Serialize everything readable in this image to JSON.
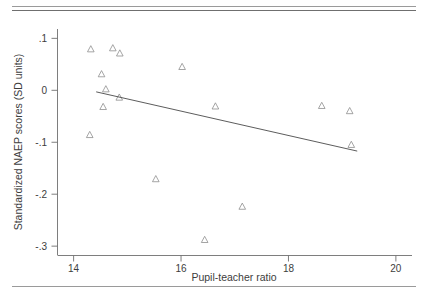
{
  "figure": {
    "background": "#ffffff",
    "rules": [
      {
        "name": "top-rule-upper",
        "color": "#9a9a9a"
      },
      {
        "name": "top-rule-lower",
        "color": "#6f6f6f"
      },
      {
        "name": "bottom-rule",
        "color": "#9a9a9a"
      }
    ]
  },
  "chart_data": {
    "type": "scatter",
    "title": "",
    "xlabel": "Pupil-teacher ratio",
    "ylabel": "Standardized NAEP scores (SD units)",
    "xlim": [
      13.7,
      20.3
    ],
    "ylim": [
      -0.318,
      0.118
    ],
    "xticks": [
      14,
      16,
      18,
      20
    ],
    "xticklabels": [
      "14",
      "16",
      "18",
      "20"
    ],
    "yticks": [
      0.1,
      0,
      -0.1,
      -0.2,
      -0.3
    ],
    "yticklabels": [
      ".1",
      "0",
      "-.1",
      "-.2",
      "-.3"
    ],
    "grid": false,
    "legend": false,
    "marker": "triangle-up-open",
    "marker_color": "#8e8e8e",
    "points": [
      {
        "x": 14.32,
        "y": 0.079
      },
      {
        "x": 14.73,
        "y": 0.081
      },
      {
        "x": 14.86,
        "y": 0.071
      },
      {
        "x": 14.52,
        "y": 0.031
      },
      {
        "x": 14.6,
        "y": 0.002
      },
      {
        "x": 14.85,
        "y": -0.014
      },
      {
        "x": 14.55,
        "y": -0.032
      },
      {
        "x": 14.3,
        "y": -0.086
      },
      {
        "x": 16.02,
        "y": 0.045
      },
      {
        "x": 16.64,
        "y": -0.031
      },
      {
        "x": 18.62,
        "y": -0.03
      },
      {
        "x": 19.14,
        "y": -0.04
      },
      {
        "x": 19.17,
        "y": -0.105
      },
      {
        "x": 15.53,
        "y": -0.171
      },
      {
        "x": 17.14,
        "y": -0.224
      },
      {
        "x": 16.44,
        "y": -0.288
      }
    ],
    "fit_line": {
      "name": "linear-fit",
      "x_start": 14.42,
      "y_start": -0.003,
      "x_end": 19.28,
      "y_end": -0.117,
      "color": "#4a4a4a"
    }
  }
}
